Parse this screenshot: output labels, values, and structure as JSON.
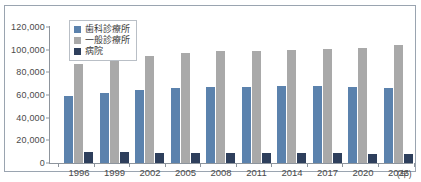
{
  "chart_data": {
    "type": "bar",
    "title": "",
    "subtitle": "",
    "xlabel": "年",
    "ylabel": "",
    "categories": [
      "1996",
      "1999",
      "2002",
      "2005",
      "2008",
      "2011",
      "2014",
      "2017",
      "2020",
      "2023"
    ],
    "series": [
      {
        "name": "歯科診療所",
        "color": "#5b82ad",
        "values": [
          59000,
          62000,
          64500,
          66000,
          67300,
          67500,
          68000,
          68000,
          66800,
          66000
        ]
      },
      {
        "name": "一般診療所",
        "color": "#a9a9a9",
        "values": [
          87000,
          91000,
          94500,
          97000,
          98500,
          99000,
          100000,
          100500,
          101500,
          104500
        ]
      },
      {
        "name": "病院",
        "color": "#2e3f5c",
        "values": [
          9500,
          9300,
          9200,
          9000,
          8800,
          8600,
          8500,
          8400,
          8200,
          8100
        ]
      }
    ],
    "ylim": [
      0,
      120000
    ],
    "ytick_values": [
      0,
      20000,
      40000,
      60000,
      80000,
      100000,
      120000
    ],
    "ytick_labels": [
      "0",
      "20,000",
      "40,000",
      "60,000",
      "80,000",
      "100,000",
      "120,000"
    ],
    "grid": false,
    "legend_position": "top-left"
  },
  "axis": {
    "unit_label": "(年)"
  }
}
